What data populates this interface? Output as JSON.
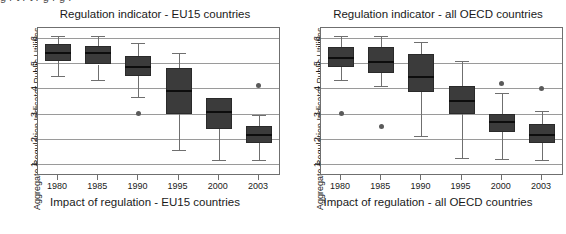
{
  "top_cut_text": "g          r            t    r     t      r            g        r       g          r",
  "axis": {
    "y_title": "Aggregate Regulation Indicator Public Utilities",
    "y_ticks": [
      1,
      2,
      3,
      4,
      5,
      6
    ],
    "y_min": 0.6,
    "y_max": 6.4,
    "x_ticks": [
      "1980",
      "1985",
      "1990",
      "1995",
      "2000",
      "2003"
    ]
  },
  "panels": [
    {
      "title": "Regulation indicator - EU15 countries",
      "xlabel": "Impact of regulation - EU15 countries"
    },
    {
      "title": "Regulation indicator - all OECD countries",
      "xlabel": "Impact of regulation - all OECD countries"
    }
  ],
  "chart_data": [
    {
      "type": "box",
      "title": "Regulation indicator - EU15 countries",
      "xlabel": "Impact of regulation - EU15 countries",
      "ylabel": "Aggregate Regulation Indicator Public Utilities",
      "ylim": [
        0.6,
        6.4
      ],
      "yticks": [
        1,
        2,
        3,
        4,
        5,
        6
      ],
      "grid": true,
      "legend": "none",
      "categories": [
        "1980",
        "1985",
        "1990",
        "1995",
        "2000",
        "2003"
      ],
      "boxes": [
        {
          "category": "1980",
          "whisker_low": 4.5,
          "q1": 5.1,
          "median": 5.4,
          "q3": 5.75,
          "whisker_high": 6.1,
          "outliers": []
        },
        {
          "category": "1985",
          "whisker_low": 4.35,
          "q1": 4.95,
          "median": 5.4,
          "q3": 5.7,
          "whisker_high": 6.1,
          "outliers": []
        },
        {
          "category": "1990",
          "whisker_low": 3.65,
          "q1": 4.5,
          "median": 4.85,
          "q3": 5.3,
          "whisker_high": 5.8,
          "outliers": [
            3.0
          ]
        },
        {
          "category": "1995",
          "whisker_low": 1.55,
          "q1": 3.0,
          "median": 3.9,
          "q3": 4.8,
          "whisker_high": 5.4,
          "outliers": []
        },
        {
          "category": "2000",
          "whisker_low": 1.15,
          "q1": 2.4,
          "median": 3.05,
          "q3": 3.6,
          "whisker_high": 3.6,
          "outliers": []
        },
        {
          "category": "2003",
          "whisker_low": 1.15,
          "q1": 1.85,
          "median": 2.15,
          "q3": 2.5,
          "whisker_high": 2.95,
          "outliers": [
            4.1
          ]
        }
      ]
    },
    {
      "type": "box",
      "title": "Regulation indicator - all OECD countries",
      "xlabel": "Impact of regulation - all OECD countries",
      "ylabel": "Aggregate Regulation Indicator Public Utilities",
      "ylim": [
        0.6,
        6.4
      ],
      "yticks": [
        1,
        2,
        3,
        4,
        5,
        6
      ],
      "grid": true,
      "legend": "none",
      "categories": [
        "1980",
        "1985",
        "1990",
        "1995",
        "2000",
        "2003"
      ],
      "boxes": [
        {
          "category": "1980",
          "whisker_low": 4.35,
          "q1": 4.85,
          "median": 5.2,
          "q3": 5.65,
          "whisker_high": 6.1,
          "outliers": [
            3.0
          ]
        },
        {
          "category": "1985",
          "whisker_low": 4.1,
          "q1": 4.6,
          "median": 5.05,
          "q3": 5.65,
          "whisker_high": 6.1,
          "outliers": [
            2.5
          ]
        },
        {
          "category": "1990",
          "whisker_low": 2.1,
          "q1": 3.85,
          "median": 4.45,
          "q3": 5.35,
          "whisker_high": 5.85,
          "outliers": []
        },
        {
          "category": "1995",
          "whisker_low": 1.25,
          "q1": 3.0,
          "median": 3.5,
          "q3": 4.1,
          "whisker_high": 5.1,
          "outliers": []
        },
        {
          "category": "2000",
          "whisker_low": 1.2,
          "q1": 2.25,
          "median": 2.65,
          "q3": 3.0,
          "whisker_high": 3.8,
          "outliers": [
            4.2
          ]
        },
        {
          "category": "2003",
          "whisker_low": 1.15,
          "q1": 1.85,
          "median": 2.15,
          "q3": 2.6,
          "whisker_high": 3.1,
          "outliers": [
            4.0
          ]
        }
      ]
    }
  ],
  "colors": {
    "box_fill": "#3b3b3b",
    "median": "#0d0d0d",
    "whisker": "#6f6f6f",
    "grid": "#9a9a9a",
    "outlier": "#5a5a5a",
    "frame": "#6f6f6f",
    "text": "#1a1a1a",
    "background": "#ffffff"
  }
}
